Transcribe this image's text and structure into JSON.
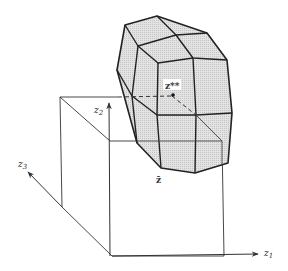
{
  "figure": {
    "type": "3d-geometric-diagram",
    "colors": {
      "background": "#ffffff",
      "polyhedron_fill": "#d9d9d9",
      "polyhedron_stroke": "#222222",
      "box_stroke": "#333333",
      "axis_stroke": "#333333"
    },
    "axes": {
      "z1": {
        "label": "z",
        "subscript": "1"
      },
      "z2": {
        "label": "z",
        "subscript": "2"
      },
      "z3": {
        "label": "z",
        "subscript": "3"
      }
    },
    "points": {
      "z_double_star": {
        "label": "z**"
      },
      "z_bar": {
        "label": "z̄"
      }
    },
    "shapes": {
      "polyhedron": "faceted convex set (shaded)",
      "box": "orthant box anchored at z-bar"
    }
  }
}
